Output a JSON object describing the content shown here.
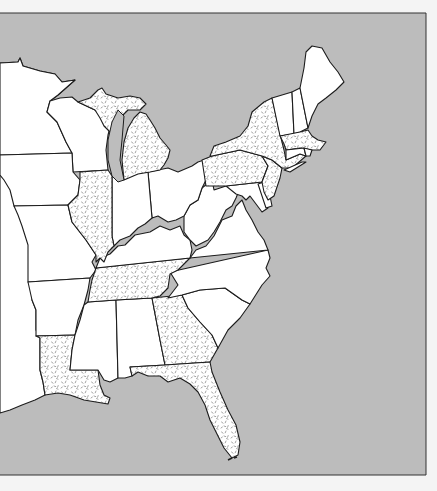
{
  "map": {
    "title": "",
    "region": "Eastern United States",
    "colors": {
      "page_background": "#f4f4f4",
      "water": "#bcbcbc",
      "land": "#ffffff",
      "border": "#1c1c1c",
      "stipple_dot": "#9a9a9a"
    },
    "frame": {
      "top": 13,
      "right": 426,
      "bottom": 475,
      "left": 0
    },
    "legend": {
      "stippled": "highlighted states",
      "plain": "other states"
    },
    "highlighted_states": [
      "Michigan",
      "Illinois",
      "New York",
      "Pennsylvania",
      "New Jersey",
      "Massachusetts",
      "Tennessee",
      "Georgia",
      "Florida",
      "Louisiana"
    ],
    "plain_states": [
      "Maine",
      "New Hampshire",
      "Vermont",
      "Connecticut",
      "Rhode Island",
      "Delaware",
      "Maryland",
      "Virginia",
      "West Virginia",
      "Ohio",
      "Indiana",
      "Kentucky",
      "North Carolina",
      "South Carolina",
      "Alabama",
      "Mississippi",
      "Arkansas",
      "Missouri",
      "Iowa",
      "Minnesota",
      "Wisconsin"
    ],
    "water_bodies": [
      "Atlantic Ocean",
      "Gulf of Mexico",
      "Great Lakes"
    ]
  }
}
